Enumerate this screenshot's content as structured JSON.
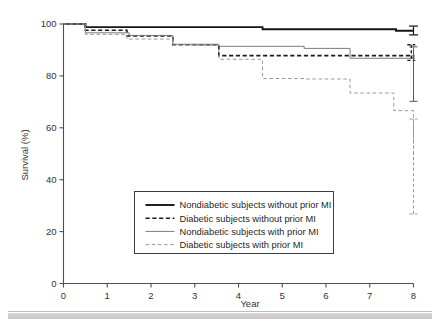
{
  "chart_data": {
    "type": "line",
    "title": "",
    "xlabel": "Year",
    "ylabel": "Survival (%)",
    "xlim": [
      0,
      8
    ],
    "ylim": [
      0,
      100
    ],
    "xticks": [
      0,
      1,
      2,
      3,
      4,
      5,
      6,
      7,
      8
    ],
    "yticks": [
      0,
      20,
      40,
      60,
      80,
      100
    ],
    "xtick_labels": [
      "0",
      "1",
      "2",
      "3",
      "4",
      "5",
      "6",
      "7",
      "8"
    ],
    "ytick_labels": [
      "0",
      "20",
      "40",
      "60",
      "80",
      "100"
    ],
    "grid": false,
    "legend_position": "lower center",
    "step_type": "post",
    "series": [
      {
        "name": "Nondiabetic subjects without prior MI",
        "key": "nd_nomi",
        "style": "solid-thick",
        "color": "#161616",
        "x": [
          0.0,
          0.5,
          4.55,
          7.6,
          8.0
        ],
        "y": [
          100.0,
          98.8,
          98.0,
          97.4,
          97.4
        ],
        "error_bar": {
          "x": 8.0,
          "low": 95.8,
          "high": 99.2,
          "center": 97.4
        }
      },
      {
        "name": "Diabetic subjects without prior MI",
        "key": "d_nomi",
        "style": "dashed-thick",
        "color": "#1c1c1c",
        "x": [
          0.0,
          0.5,
          1.45,
          2.5,
          3.55,
          7.55,
          8.0
        ],
        "y": [
          100.0,
          97.6,
          95.4,
          92.0,
          87.8,
          87.8,
          86.4
        ],
        "error_bar": {
          "x": 7.95,
          "low": 86.0,
          "high": 92.0,
          "center": 87.8
        }
      },
      {
        "name": "Nondiabetic subjects with prior MI",
        "key": "nd_mi",
        "style": "solid-thin",
        "color": "#7a7a7a",
        "x": [
          0.0,
          0.5,
          1.5,
          2.5,
          3.55,
          5.5,
          6.55,
          8.0
        ],
        "y": [
          100.0,
          96.6,
          95.6,
          92.2,
          91.4,
          90.6,
          86.8,
          82.2
        ],
        "error_bar": {
          "x": 8.0,
          "low": 70.2,
          "high": 91.2,
          "center": 82.2
        }
      },
      {
        "name": "Diabetic subjects with prior MI",
        "key": "d_mi",
        "style": "dashed-thin",
        "color": "#9a9a9a",
        "x": [
          0.0,
          0.5,
          1.45,
          2.5,
          3.55,
          4.55,
          5.5,
          6.55,
          7.55,
          8.0
        ],
        "y": [
          100.0,
          96.0,
          94.2,
          91.8,
          86.4,
          79.0,
          78.8,
          73.4,
          66.6,
          47.4
        ],
        "error_bar": {
          "x": 8.0,
          "low": 26.8,
          "high": 63.4,
          "center": 47.4
        }
      }
    ]
  },
  "legend": {
    "entries": [
      {
        "label": "Nondiabetic subjects without prior MI",
        "key": "nd_nomi"
      },
      {
        "label": "Diabetic subjects without prior MI",
        "key": "d_nomi"
      },
      {
        "label": "Nondiabetic subjects with prior MI",
        "key": "nd_mi"
      },
      {
        "label": "Diabetic subjects with prior MI",
        "key": "d_mi"
      }
    ]
  }
}
